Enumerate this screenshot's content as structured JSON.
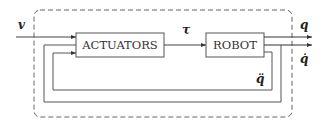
{
  "diagram": {
    "type": "block-diagram",
    "colors": {
      "line": "#555555",
      "text": "#222222",
      "background": "#ffffff"
    },
    "blocks": [
      {
        "id": "actuators",
        "label": "ACTUATORS"
      },
      {
        "id": "robot",
        "label": "ROBOT"
      }
    ],
    "signals": {
      "input": "v",
      "torque": "τ",
      "output_position": "q",
      "output_velocity": "q̇",
      "acceleration": "q̈"
    },
    "connections": [
      {
        "from": "input",
        "to": "actuators",
        "label": "v"
      },
      {
        "from": "actuators",
        "to": "robot",
        "label": "τ"
      },
      {
        "from": "robot",
        "to": "output",
        "label": "q"
      },
      {
        "from": "robot",
        "to": "output",
        "label": "q̇"
      },
      {
        "from": "robot",
        "to": "actuators",
        "label": "q̈",
        "kind": "feedback-inner"
      },
      {
        "from": "robot-velocity",
        "to": "actuators",
        "kind": "feedback-outer"
      }
    ],
    "enclosure": {
      "style": "dashed-rounded"
    }
  }
}
